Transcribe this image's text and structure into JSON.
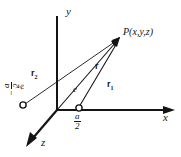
{
  "figure": {
    "type": "physics-vector-diagram",
    "background_color": "#ffffff",
    "line_color": "#141414"
  },
  "axes": {
    "y_label": "y",
    "x_label": "x",
    "z_label": "z",
    "origin": {
      "x": 57,
      "y": 110
    }
  },
  "point": {
    "label_P": "P",
    "label_coords": "(x,y,z)"
  },
  "vectors": [
    {
      "name": "r",
      "symbol": "r",
      "subscript": "",
      "from": "origin",
      "to": "P"
    },
    {
      "name": "r1",
      "symbol": "r",
      "subscript": "1",
      "from": "positive-charge",
      "to": "P"
    },
    {
      "name": "r2",
      "symbol": "r",
      "subscript": "2",
      "from": "negative-charge",
      "to": "P"
    }
  ],
  "charges": {
    "negative": {
      "charge_label_minus": "−",
      "charge_label": "e",
      "position_minus": "−",
      "position_num": "a",
      "position_den": "2"
    },
    "positive": {
      "charge_label": "e",
      "position_num": "a",
      "position_den": "2"
    }
  }
}
